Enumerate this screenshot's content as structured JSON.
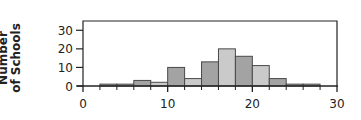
{
  "chart_data": {
    "type": "bar",
    "subtype": "histogram",
    "title": "",
    "xlabel": "",
    "ylabel": "Number of Schools",
    "ylabel_lines": [
      "Number",
      "of Schools"
    ],
    "xlim": [
      0,
      30
    ],
    "ylim": [
      0,
      35
    ],
    "x_ticks": [
      0,
      10,
      20,
      30
    ],
    "x_tick_labels": [
      "0",
      "10",
      "20",
      "30"
    ],
    "x_minor_ticks": [
      2,
      4,
      6,
      8,
      12,
      14,
      16,
      18,
      22,
      24,
      26,
      28
    ],
    "y_ticks": [
      0,
      10,
      20,
      30
    ],
    "y_tick_labels": [
      "0",
      "10",
      "20",
      "30"
    ],
    "grid": false,
    "legend": null,
    "bin_width": 2,
    "bins": [
      {
        "x0": 2,
        "x1": 4,
        "count": 1,
        "shade": "dark"
      },
      {
        "x0": 4,
        "x1": 6,
        "count": 1,
        "shade": "dark"
      },
      {
        "x0": 6,
        "x1": 8,
        "count": 3,
        "shade": "dark"
      },
      {
        "x0": 8,
        "x1": 10,
        "count": 2,
        "shade": "light"
      },
      {
        "x0": 10,
        "x1": 12,
        "count": 10,
        "shade": "dark"
      },
      {
        "x0": 12,
        "x1": 14,
        "count": 4,
        "shade": "light"
      },
      {
        "x0": 14,
        "x1": 16,
        "count": 13,
        "shade": "dark"
      },
      {
        "x0": 16,
        "x1": 18,
        "count": 20,
        "shade": "light"
      },
      {
        "x0": 18,
        "x1": 20,
        "count": 16,
        "shade": "dark"
      },
      {
        "x0": 20,
        "x1": 22,
        "count": 11,
        "shade": "light"
      },
      {
        "x0": 22,
        "x1": 24,
        "count": 4,
        "shade": "dark"
      },
      {
        "x0": 24,
        "x1": 26,
        "count": 1,
        "shade": "dark"
      },
      {
        "x0": 26,
        "x1": 28,
        "count": 1,
        "shade": "dark"
      }
    ],
    "categories": [
      "2-4",
      "4-6",
      "6-8",
      "8-10",
      "10-12",
      "12-14",
      "14-16",
      "16-18",
      "18-20",
      "20-22",
      "22-24",
      "24-26",
      "26-28"
    ],
    "values": [
      1,
      1,
      3,
      2,
      10,
      4,
      13,
      20,
      16,
      11,
      4,
      1,
      1
    ]
  },
  "colors": {
    "dark_bar": "#a3a3a3",
    "light_bar": "#cacaca",
    "bar_outline": "#4a4a4a",
    "axis": "#222222",
    "text": "#222222"
  }
}
